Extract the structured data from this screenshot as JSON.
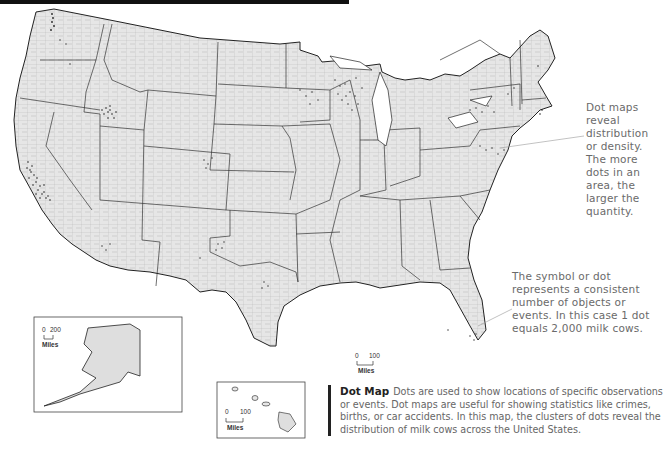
{
  "header": {
    "bar_color": "#111111"
  },
  "map": {
    "title": "Dot Map",
    "subject": "Distribution of milk cows across the United States",
    "land_fill": "#e6e6e6",
    "state_border_color": "#222222",
    "county_border_color": "#9a9a9a",
    "dot_color": "#222222",
    "scale_bars": {
      "conus": {
        "start": "0",
        "end": "100",
        "unit": "Miles"
      },
      "alaska": {
        "start": "0",
        "end": "200",
        "unit": "Miles"
      },
      "hawaii": {
        "start": "0",
        "end": "100",
        "unit": "Miles"
      }
    },
    "insets": [
      "Alaska",
      "Hawaii"
    ]
  },
  "callouts": [
    {
      "text": "Dot maps reveal distribution or density. The more dots in an area, the larger the quantity."
    },
    {
      "text": "The symbol or dot represents a consistent number of objects or events. In this case 1 dot equals 2,000 milk cows."
    }
  ],
  "caption": {
    "title": "Dot Map",
    "body": "Dots are used to show locations of specific observations or events. Dot maps are useful for showing statistics like crimes, births, or car accidents. In this map, the clusters of dots reveal the distribution of milk cows across the United States."
  }
}
